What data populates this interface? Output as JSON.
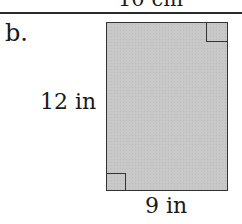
{
  "previous_figure": {
    "dimension_label": "10 cm"
  },
  "figure": {
    "part_label": "b.",
    "shape": "rectangle",
    "height_label": "12 in",
    "width_label": "9 in",
    "right_angle_markers": [
      "top-right",
      "bottom-left"
    ],
    "fill_color": "#c8c8c8",
    "stroke_color": "#333333"
  }
}
